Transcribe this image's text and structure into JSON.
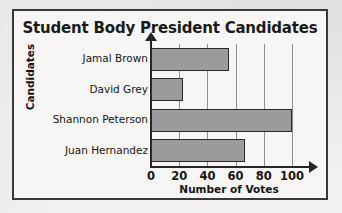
{
  "chart_data": {
    "type": "bar",
    "orientation": "horizontal",
    "title": "Student Body President Candidates",
    "xlabel": "Number of Votes",
    "ylabel": "Candidates",
    "categories": [
      "Jamal Brown",
      "David Grey",
      "Shannon Peterson",
      "Juan Hernandez"
    ],
    "values": [
      55,
      23,
      100,
      67
    ],
    "xlim": [
      0,
      100
    ],
    "xticks": [
      0,
      20,
      40,
      60,
      80,
      100
    ],
    "xtick_labels": [
      "0",
      "20",
      "40",
      "60",
      "80",
      "100"
    ],
    "grid": "vertical",
    "legend": "none",
    "bar_fill_color": "#9b9b9b",
    "bar_edge_color": "#2a2a2a",
    "axis_color": "#252525",
    "gridline_color": "#8d8d8d",
    "frame_border_color": "#3a3a3a",
    "background_color": "#f7f6f4"
  }
}
